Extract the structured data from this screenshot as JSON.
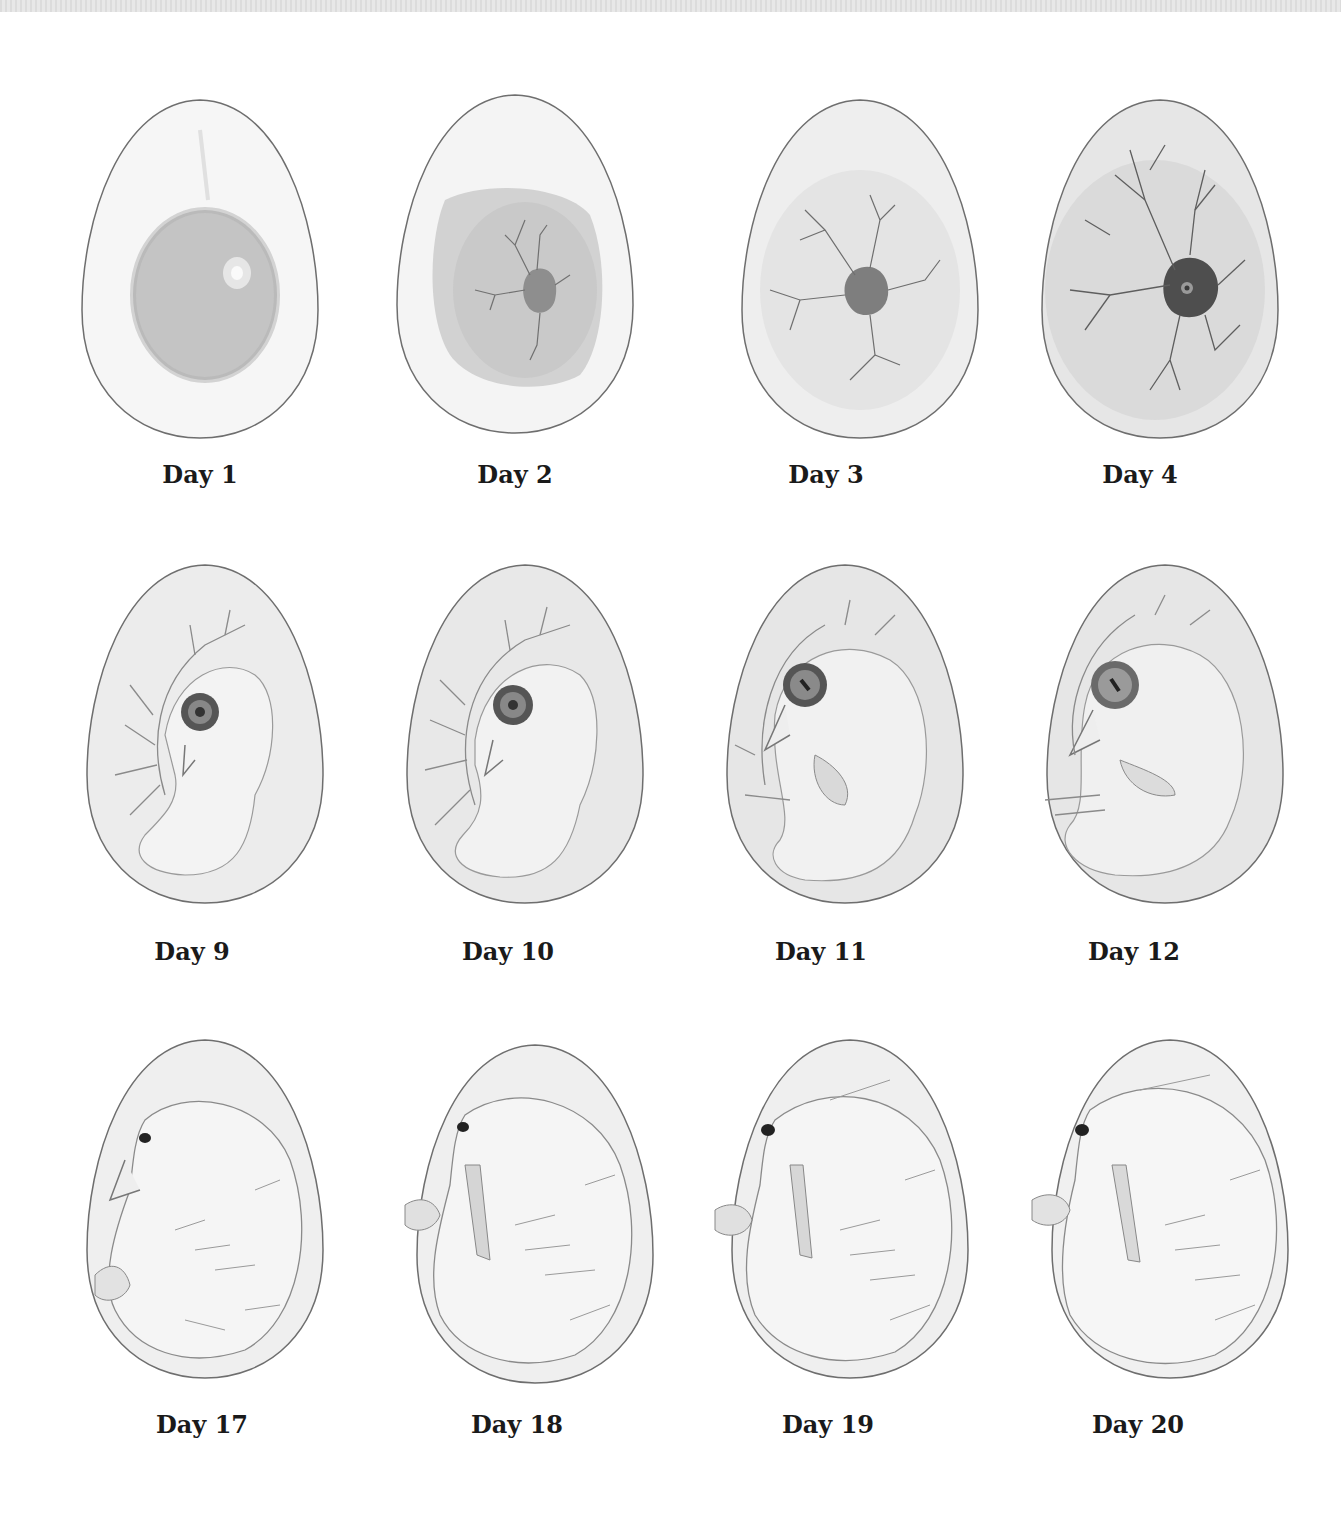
{
  "figure": {
    "rows": [
      {
        "stage": "early",
        "eggs": [
          {
            "label": "Day 1",
            "content": "yolk with germinal disc"
          },
          {
            "label": "Day 2",
            "content": "yolk with small embryo and first blood vessels"
          },
          {
            "label": "Day 3",
            "content": "embryo with spreading blood vessel network"
          },
          {
            "label": "Day 4",
            "content": "dark embryo with eye and dense vessel network"
          }
        ]
      },
      {
        "stage": "middle",
        "eggs": [
          {
            "label": "Day 9",
            "content": "curled embryo with large eye and vessels"
          },
          {
            "label": "Day 10",
            "content": "curled embryo with beak forming"
          },
          {
            "label": "Day 11",
            "content": "embryo with beak, wings and legs visible"
          },
          {
            "label": "Day 12",
            "content": "larger embryo filling the egg"
          }
        ]
      },
      {
        "stage": "late",
        "eggs": [
          {
            "label": "Day 17",
            "content": "feathered chick curled in egg"
          },
          {
            "label": "Day 18",
            "content": "feathered chick with legs folded"
          },
          {
            "label": "Day 19",
            "content": "chick positioned for hatching"
          },
          {
            "label": "Day 20",
            "content": "fully formed chick ready to hatch"
          }
        ]
      }
    ]
  },
  "colors": {
    "background": "#ffffff",
    "egg_outline": "#6e6e6e",
    "egg_fill": "#f2f2f2",
    "yolk": "#bdbdbd",
    "vessel": "#707070",
    "embryo_dark": "#555555",
    "label_text": "#1a1a1a"
  }
}
